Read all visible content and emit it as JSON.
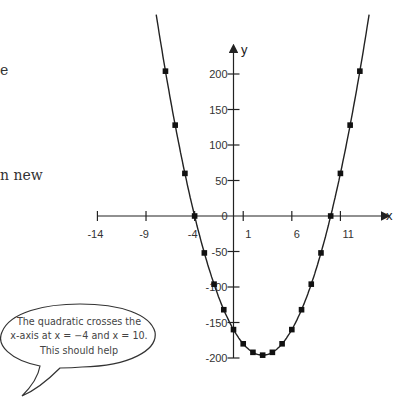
{
  "page_fragments": {
    "line1_tail": "e",
    "line2_tail": "n new"
  },
  "speech_bubble": {
    "lines": [
      "The quadratic crosses the",
      "x-axis at x = −4 and x = 10.",
      "This should help"
    ]
  },
  "chart_data": {
    "type": "scatter",
    "title": "",
    "equation_implied": "y = 4x^2 - 24x - 160",
    "xlabel": "x",
    "ylabel": "y",
    "x_ticks": [
      -14,
      -9,
      -4,
      1,
      6,
      11
    ],
    "y_ticks": [
      -200,
      -150,
      -100,
      -50,
      0,
      50,
      100,
      150,
      200
    ],
    "xlim": [
      -14,
      14.5
    ],
    "ylim": [
      -200,
      290
    ],
    "grid": false,
    "legend": null,
    "series": [
      {
        "name": "quadratic",
        "style": "line with square markers",
        "x": [
          -7,
          -6,
          -5,
          -4,
          -3,
          -2,
          -1,
          0,
          1,
          2,
          3,
          4,
          5,
          6,
          7,
          8,
          9,
          10,
          11,
          12,
          13
        ],
        "y": [
          204,
          128,
          60,
          0,
          -52,
          -96,
          -132,
          -160,
          -180,
          -192,
          -196,
          -192,
          -180,
          -160,
          -132,
          -96,
          -52,
          0,
          60,
          128,
          204
        ]
      }
    ],
    "annotations": [
      "x-intercepts at x = -4 and x = 10"
    ]
  }
}
